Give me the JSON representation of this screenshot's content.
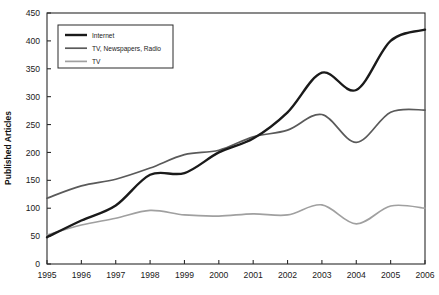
{
  "chart_data": {
    "type": "line",
    "title": "",
    "xlabel": "",
    "ylabel": "Published Articles",
    "x": [
      1995,
      1996,
      1997,
      1998,
      1999,
      2000,
      2001,
      2002,
      2003,
      2004,
      2005,
      2006
    ],
    "xtick_labels": [
      "1995",
      "1996",
      "1997",
      "1998",
      "1999",
      "2000",
      "2001",
      "2002",
      "2003",
      "2004",
      "2005",
      "2006"
    ],
    "ytick_labels": [
      "0",
      "50",
      "100",
      "150",
      "200",
      "250",
      "300",
      "350",
      "400",
      "450"
    ],
    "yticks": [
      0,
      50,
      100,
      150,
      200,
      250,
      300,
      350,
      400,
      450
    ],
    "xlim": [
      1995,
      2006
    ],
    "ylim": [
      0,
      450
    ],
    "grid": false,
    "legend_position": "top-left",
    "series": [
      {
        "name": "Internet",
        "color": "#1a1a1a",
        "width": 2.4,
        "values": [
          48,
          78,
          105,
          160,
          163,
          200,
          225,
          272,
          343,
          312,
          400,
          420
        ]
      },
      {
        "name": "TV, Newspapers, Radio",
        "color": "#5a5a5a",
        "width": 1.7,
        "values": [
          118,
          140,
          152,
          172,
          196,
          204,
          228,
          240,
          268,
          218,
          272,
          276
        ]
      },
      {
        "name": "TV",
        "color": "#a0a0a0",
        "width": 1.7,
        "values": [
          52,
          70,
          82,
          96,
          88,
          86,
          90,
          88,
          106,
          72,
          104,
          100
        ]
      }
    ]
  }
}
